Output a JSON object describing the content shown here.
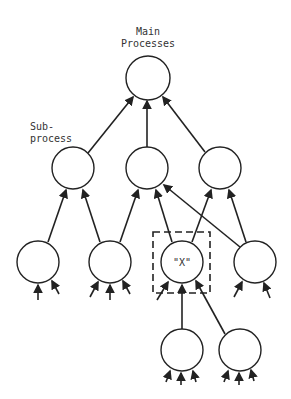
{
  "diagram": {
    "type": "hierarchy",
    "labels": {
      "main_line1": "Main",
      "main_line2": "Processes",
      "sub_line1": "Sub-",
      "sub_line2": "process",
      "x_node": "\"X\""
    },
    "nodes": [
      {
        "id": "main",
        "cx": 148,
        "cy": 78
      },
      {
        "id": "sub1",
        "cx": 73,
        "cy": 168
      },
      {
        "id": "sub2",
        "cx": 147,
        "cy": 168
      },
      {
        "id": "sub3",
        "cx": 220,
        "cy": 168
      },
      {
        "id": "leaf1",
        "cx": 38,
        "cy": 262
      },
      {
        "id": "leaf2",
        "cx": 110,
        "cy": 262
      },
      {
        "id": "x",
        "cx": 182,
        "cy": 262
      },
      {
        "id": "leaf4",
        "cx": 255,
        "cy": 262
      },
      {
        "id": "leaf5",
        "cx": 182,
        "cy": 350
      },
      {
        "id": "leaf6",
        "cx": 240,
        "cy": 350
      }
    ],
    "edges": [
      [
        "sub1",
        "main"
      ],
      [
        "sub2",
        "main"
      ],
      [
        "sub3",
        "main"
      ],
      [
        "leaf1",
        "sub1"
      ],
      [
        "leaf2",
        "sub1"
      ],
      [
        "leaf2",
        "sub2"
      ],
      [
        "x",
        "sub2"
      ],
      [
        "leaf4",
        "sub2"
      ],
      [
        "x",
        "sub3"
      ],
      [
        "leaf4",
        "sub3"
      ],
      [
        "leaf5",
        "x"
      ],
      [
        "leaf6",
        "x"
      ]
    ]
  }
}
